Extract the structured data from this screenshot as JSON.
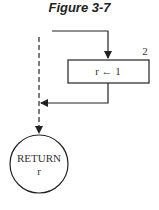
{
  "figure": {
    "title": "Figure 3-7",
    "step_number": "2",
    "assignment_box": "r ← 1",
    "return_node": {
      "keyword": "RETURN",
      "value": "r"
    }
  }
}
